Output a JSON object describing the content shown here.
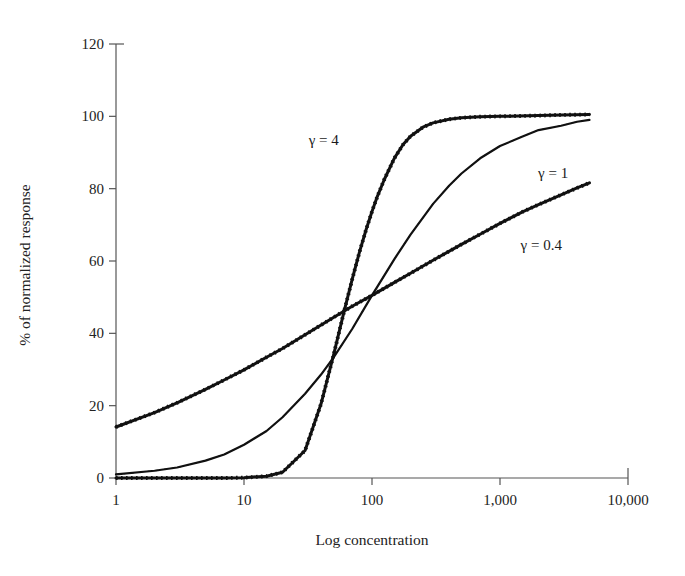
{
  "chart_data": {
    "type": "line",
    "title": "",
    "subtitle": "",
    "xlabel": "Log concentration",
    "ylabel": "% of normalized response",
    "xscale": "log",
    "xlim": [
      1,
      10000
    ],
    "ylim": [
      0,
      120
    ],
    "xticks": [
      1,
      10,
      100,
      1000,
      10000
    ],
    "xticklabels": [
      "1",
      "10",
      "100",
      "1,000",
      "10,000"
    ],
    "yticks": [
      0,
      20,
      40,
      60,
      80,
      100,
      120
    ],
    "yticklabels": [
      "0",
      "20",
      "40",
      "60",
      "80",
      "100",
      "120"
    ],
    "grid": false,
    "legend": "inline-annotations",
    "ec50": 100,
    "annotations": [
      {
        "name": "gamma-4-label",
        "text": "γ = 4",
        "x": 42,
        "y": 92
      },
      {
        "name": "gamma-1-label",
        "text": "γ = 1",
        "x": 2600,
        "y": 83
      },
      {
        "name": "gamma-04-label",
        "text": "γ = 0.4",
        "x": 2100,
        "y": 63
      }
    ],
    "series": [
      {
        "name": "γ = 4",
        "gamma": 4,
        "emax": 101,
        "color": "#111111",
        "marker": "square",
        "x": [
          1,
          2,
          3,
          5,
          7,
          10,
          15,
          20,
          30,
          40,
          50,
          60,
          70,
          80,
          90,
          100,
          110,
          125,
          150,
          175,
          200,
          250,
          300,
          400,
          500,
          700,
          1000,
          2000,
          3000,
          5000
        ],
        "y": [
          0.0,
          0.0,
          0.0,
          0.0,
          0.0,
          0.1,
          0.5,
          1.6,
          7.6,
          20.5,
          33.9,
          45.5,
          54.9,
          62.6,
          68.7,
          73.7,
          77.8,
          82.6,
          88.5,
          92.2,
          94.5,
          97.0,
          98.2,
          99.2,
          99.6,
          99.9,
          100.0,
          100.2,
          100.4,
          100.5
        ]
      },
      {
        "name": "γ = 1",
        "gamma": 1,
        "emax": 101,
        "color": "#111111",
        "marker": "line",
        "x": [
          1,
          2,
          3,
          5,
          7,
          10,
          15,
          20,
          30,
          40,
          50,
          70,
          100,
          150,
          200,
          300,
          400,
          500,
          700,
          1000,
          1500,
          2000,
          3000,
          4000,
          5000
        ],
        "y": [
          1.0,
          2.0,
          2.9,
          4.8,
          6.5,
          9.2,
          13.0,
          16.8,
          23.3,
          28.6,
          33.3,
          41.2,
          50.5,
          60.6,
          67.3,
          75.8,
          80.8,
          84.2,
          88.4,
          91.8,
          94.4,
          96.2,
          97.4,
          98.5,
          99.0
        ]
      },
      {
        "name": "γ = 0.4",
        "gamma": 0.4,
        "emax": 101,
        "color": "#777777",
        "marker": "square",
        "x": [
          1,
          2,
          3,
          5,
          7,
          10,
          15,
          20,
          30,
          50,
          70,
          100,
          150,
          200,
          300,
          500,
          700,
          1000,
          1500,
          2000,
          3000,
          4000,
          5000
        ],
        "y": [
          14.1,
          18.1,
          20.8,
          24.5,
          27.1,
          29.9,
          33.4,
          35.8,
          39.6,
          44.4,
          47.5,
          50.5,
          54.1,
          56.6,
          60.2,
          64.6,
          67.4,
          70.4,
          73.6,
          75.6,
          78.3,
          80.2,
          81.6
        ]
      }
    ]
  },
  "figure": {
    "xlabel": "Log concentration",
    "ylabel": "% of normalized response"
  }
}
